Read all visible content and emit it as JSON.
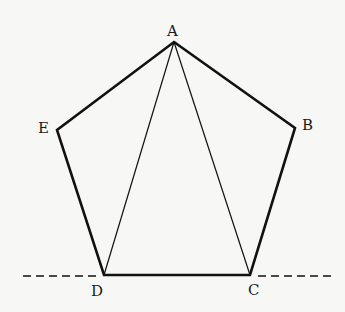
{
  "diagram": {
    "vertices": {
      "A": {
        "label": "A",
        "x": 174,
        "y": 42
      },
      "B": {
        "label": "B",
        "x": 295,
        "y": 128
      },
      "C": {
        "label": "C",
        "x": 250,
        "y": 275
      },
      "D": {
        "label": "D",
        "x": 104,
        "y": 275
      },
      "E": {
        "label": "E",
        "x": 57,
        "y": 130
      }
    },
    "edges": [
      "AB",
      "BC",
      "CD",
      "DE",
      "EA"
    ],
    "diagonals": [
      "AD",
      "AC"
    ],
    "extension_line": {
      "style": "dashed",
      "through": [
        "D",
        "C"
      ]
    },
    "colors": {
      "stroke": "#111111",
      "background": "#f7f7f5"
    }
  }
}
